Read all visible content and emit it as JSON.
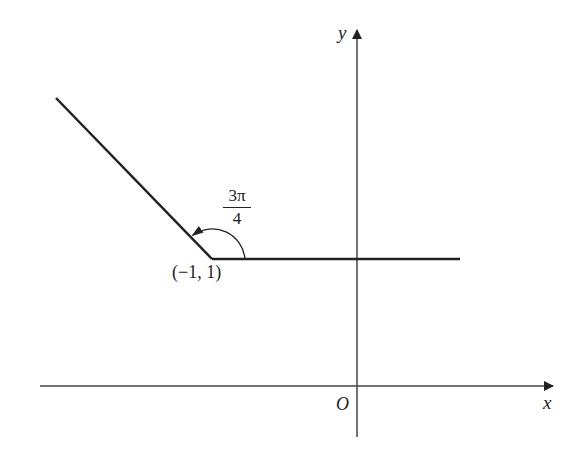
{
  "diagram": {
    "axes": {
      "x_label": "x",
      "y_label": "y",
      "origin_label": "O"
    },
    "point_label": "(−1, 1)",
    "angle": {
      "numerator": "3π",
      "denominator": "4"
    },
    "colors": {
      "line": "#222222",
      "axis": "#444444"
    }
  }
}
